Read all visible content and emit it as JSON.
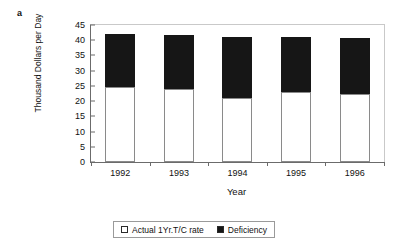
{
  "panel_label": "a",
  "chart_data": {
    "type": "bar",
    "subtype": "stacked",
    "title": "",
    "xlabel": "Year",
    "ylabel": "Thousand Dollars per Day",
    "categories": [
      "1992",
      "1993",
      "1994",
      "1995",
      "1996"
    ],
    "series": [
      {
        "name": "Actual 1Yr.T/C rate",
        "color": "#ffffff",
        "values": [
          24.5,
          24.0,
          21.0,
          23.0,
          22.3
        ]
      },
      {
        "name": "Deficiency",
        "color": "#161616",
        "values": [
          17.5,
          17.7,
          20.0,
          18.0,
          18.5
        ]
      }
    ],
    "totals": [
      42.0,
      41.7,
      41.0,
      41.0,
      40.8
    ],
    "ylim": [
      0,
      45
    ],
    "ytick_step": 5,
    "yticks": [
      0,
      5,
      10,
      15,
      20,
      25,
      30,
      35,
      40,
      45
    ],
    "grid": false,
    "legend_position": "bottom"
  },
  "legend": {
    "items": [
      {
        "label": "Actual 1Yr.T/C rate",
        "swatch": "white"
      },
      {
        "label": "Deficiency",
        "swatch": "black"
      }
    ]
  }
}
